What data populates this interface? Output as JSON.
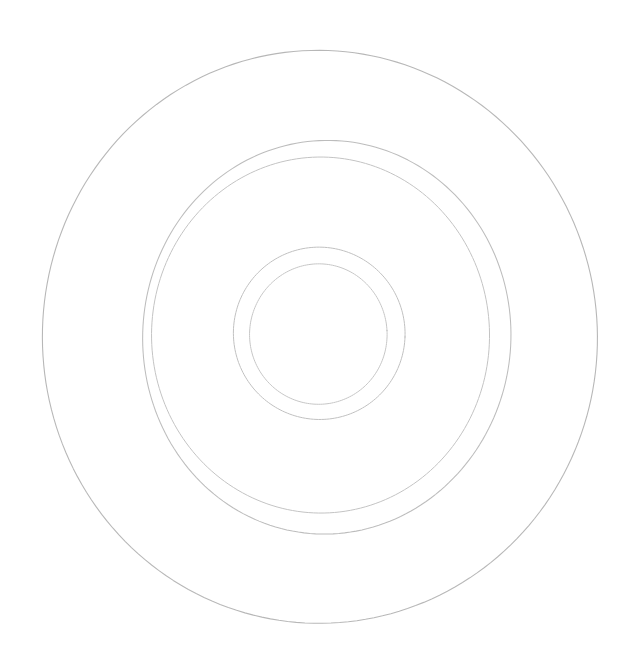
{
  "document": {
    "title": "Concentric Circles Line Drawing",
    "subject": "concentric-rings-disc-outline",
    "background_color": "#ffffff",
    "width": 632,
    "height": 664,
    "medium": "faint pencil / scanned line art",
    "caption": ""
  },
  "drawing": {
    "name": "concentric-circles-sketch",
    "stroke_color": "#b9b9b9",
    "stroke_color_light": "#d2d2d2",
    "stroke_color_dark": "#9a9a9a",
    "stroke_width": 1,
    "ring_count": 5,
    "rings": [
      {
        "id": "ring-outer",
        "label": "outer rim circle",
        "center_x": 321,
        "center_y": 337,
        "radius_x": 277,
        "radius_y": 287,
        "stroke": "#b4b4b4",
        "stroke_width": 1.1,
        "opacity": 0.95,
        "rotation": -2,
        "wobble": 2.6,
        "seed": 11
      },
      {
        "id": "ring-second",
        "label": "second ring outer edge",
        "center_x": 326,
        "center_y": 336,
        "radius_x": 184,
        "radius_y": 197,
        "stroke": "#b8b8b8",
        "stroke_width": 1.05,
        "opacity": 0.93,
        "rotation": 3,
        "wobble": 2.2,
        "seed": 23
      },
      {
        "id": "ring-third",
        "label": "second ring inner edge",
        "center_x": 321,
        "center_y": 336,
        "radius_x": 169,
        "radius_y": 178,
        "stroke": "#bdbdbd",
        "stroke_width": 1.0,
        "opacity": 0.9,
        "rotation": -1,
        "wobble": 1.8,
        "seed": 37
      },
      {
        "id": "ring-hub-outer",
        "label": "central hub outer circle",
        "center_x": 319,
        "center_y": 334,
        "radius_x": 86,
        "radius_y": 86,
        "stroke": "#bbbbbb",
        "stroke_width": 1.0,
        "opacity": 0.92,
        "rotation": 2,
        "wobble": 1.3,
        "seed": 53
      },
      {
        "id": "ring-hub-inner",
        "label": "central hub inner circle",
        "center_x": 319,
        "center_y": 334,
        "radius_x": 69,
        "radius_y": 70,
        "stroke": "#c0c0c0",
        "stroke_width": 1.0,
        "opacity": 0.9,
        "rotation": -3,
        "wobble": 1.1,
        "seed": 71
      }
    ]
  }
}
